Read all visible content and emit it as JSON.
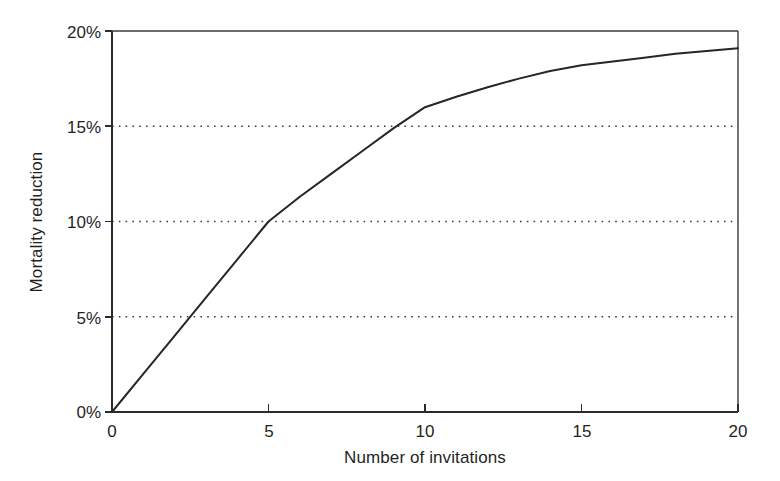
{
  "figure": {
    "background_color": "#ffffff",
    "ink_color": "#262626"
  },
  "chart_data": {
    "type": "line",
    "title": "",
    "subtitle": "",
    "xlabel": "Number of invitations",
    "ylabel": "Mortality reduction",
    "xlim": [
      0,
      20
    ],
    "ylim": [
      0,
      20
    ],
    "xticks": [
      0,
      5,
      10,
      15,
      20
    ],
    "yticks": [
      0,
      5,
      10,
      15,
      20
    ],
    "xtick_labels": [
      "0",
      "5",
      "10",
      "15",
      "20"
    ],
    "ytick_labels": [
      "0%",
      "5%",
      "10%",
      "15%",
      "20%"
    ],
    "grid": {
      "horizontal": true,
      "vertical": false,
      "style": "dotted",
      "levels": [
        5,
        10,
        15
      ]
    },
    "legend": {
      "visible": false,
      "position": "none",
      "entries": []
    },
    "annotations": [],
    "series": [
      {
        "name": "Mortality reduction",
        "color": "#262626",
        "line_style": "solid",
        "markers": "none",
        "x": [
          0,
          1,
          2,
          3,
          4,
          5,
          6,
          7,
          8,
          9,
          10,
          11,
          12,
          13,
          14,
          15,
          16,
          17,
          18,
          19,
          20
        ],
        "values": [
          0,
          2.0,
          4.0,
          6.0,
          8.0,
          10.0,
          11.3,
          12.5,
          13.7,
          14.9,
          16.0,
          16.55,
          17.05,
          17.5,
          17.9,
          18.2,
          18.4,
          18.6,
          18.8,
          18.95,
          19.1
        ]
      }
    ],
    "key_points": [
      {
        "x": 0,
        "y": 0
      },
      {
        "x": 5,
        "y": 10
      },
      {
        "x": 10,
        "y": 16
      },
      {
        "x": 15,
        "y": 18.2
      },
      {
        "x": 20,
        "y": 19.1
      }
    ]
  },
  "axes": {
    "y_axis_label": "Mortality reduction",
    "x_axis_label": "Number of invitations",
    "y_tick_0": "0%",
    "y_tick_1": "5%",
    "y_tick_2": "10%",
    "y_tick_3": "15%",
    "y_tick_4": "20%",
    "x_tick_0": "0",
    "x_tick_1": "5",
    "x_tick_2": "10",
    "x_tick_3": "15",
    "x_tick_4": "20"
  }
}
